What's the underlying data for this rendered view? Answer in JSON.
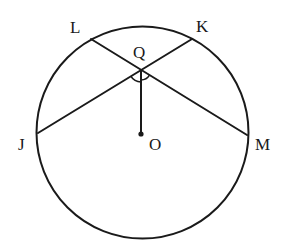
{
  "diagram": {
    "type": "circle-geometry",
    "circle": {
      "center": "O",
      "cx": 142.5,
      "cy": 132.5,
      "r": 106
    },
    "points": {
      "L": {
        "label": "L",
        "x": 91,
        "y": 39,
        "label_x": 70,
        "label_y": 33
      },
      "K": {
        "label": "K",
        "x": 192,
        "y": 39,
        "label_x": 196,
        "label_y": 32
      },
      "Q": {
        "label": "Q",
        "x": 141,
        "y": 70,
        "label_x": 133,
        "label_y": 58
      },
      "J": {
        "label": "J",
        "x": 38,
        "y": 133,
        "label_x": 18,
        "label_y": 150
      },
      "O": {
        "label": "O",
        "x": 141,
        "y": 134,
        "label_x": 149,
        "label_y": 150
      },
      "M": {
        "label": "M",
        "x": 247,
        "y": 135,
        "label_x": 255,
        "label_y": 150
      }
    },
    "segments": [
      {
        "name": "chord-LM",
        "from": "L",
        "to": "M"
      },
      {
        "name": "chord-JK",
        "from": "J",
        "to": "K"
      },
      {
        "name": "segment-QO",
        "from": "Q",
        "to": "O"
      }
    ],
    "angle_marks": [
      {
        "name": "angle-JQO",
        "vertex": "Q",
        "between": [
          "J",
          "O"
        ]
      },
      {
        "name": "angle-OQM",
        "vertex": "Q",
        "between": [
          "O",
          "M"
        ]
      }
    ]
  }
}
